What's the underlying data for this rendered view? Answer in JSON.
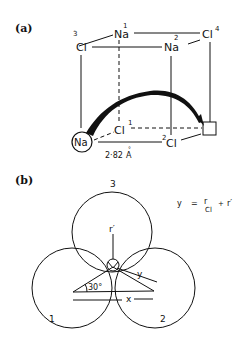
{
  "panel_a": {
    "label": "(a)",
    "atoms": {
      "na1": {
        "symbol": "Na",
        "index": "1"
      },
      "na2": {
        "symbol": "Na",
        "index": "2"
      },
      "cl3": {
        "symbol": "Cl",
        "index": "3"
      },
      "cl4": {
        "symbol": "Cl",
        "index": "4"
      },
      "cl1": {
        "symbol": "Cl",
        "index": "1"
      },
      "cl2": {
        "symbol": "Cl",
        "index": "2"
      },
      "na_moving": {
        "symbol": "Na"
      }
    },
    "distance": {
      "value": "2·82",
      "unit": "Å",
      "unit_base": "A",
      "unit_ring": "°"
    }
  },
  "panel_b": {
    "label": "(b)",
    "circles": [
      "1",
      "2",
      "3"
    ],
    "labels": {
      "r_prime": "r′",
      "y": "y",
      "x": "x",
      "angle": "30°"
    },
    "equation": {
      "lhs": "y",
      "eq": "=",
      "r": "r",
      "sub": "Cl",
      "plus": "+",
      "r_prime": "r′"
    }
  }
}
